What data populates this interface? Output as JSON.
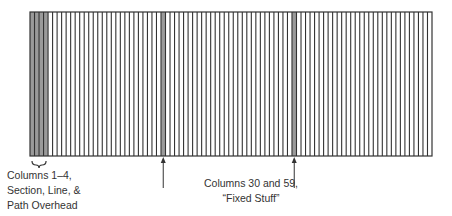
{
  "diagram": {
    "grid": {
      "x": 30,
      "y": 12,
      "width": 402,
      "height": 144,
      "column_count": 89,
      "line_color": "#333333",
      "highlight_color": "#9a9a9a",
      "background": "#ffffff",
      "highlighted_columns": [
        1,
        2,
        3,
        4,
        30,
        59
      ]
    },
    "annotations": [
      {
        "id": "overhead",
        "lines": [
          "Columns 1–4,",
          "Section, Line, &",
          "Path Overhead"
        ],
        "marker": "brace",
        "columns": [
          1,
          4
        ]
      },
      {
        "id": "fixed-stuff",
        "lines": [
          "Columns 30 and 59,",
          "“Fixed Stuff”"
        ],
        "marker": "arrows",
        "columns": [
          30,
          59
        ]
      }
    ]
  }
}
